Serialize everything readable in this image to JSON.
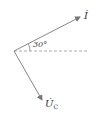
{
  "diagram": {
    "type": "phasor-diagram",
    "angle_label": "30°",
    "phasors": [
      {
        "name": "current",
        "label": "İ",
        "direction_deg": 30
      },
      {
        "name": "capacitor-voltage",
        "label": "U̇",
        "subscript": "C",
        "direction_deg": -60
      }
    ],
    "reference_line": "dashed-horizontal",
    "colors": {
      "line": "#888888",
      "dashed": "#aaaaaa",
      "text": "#333333"
    }
  }
}
